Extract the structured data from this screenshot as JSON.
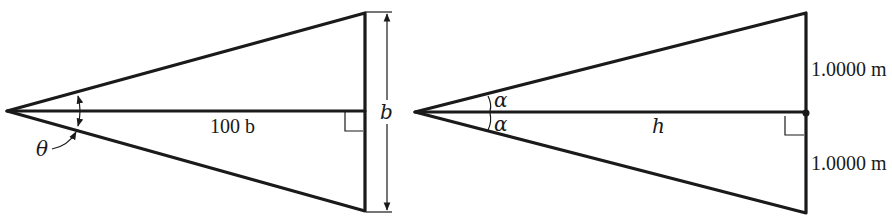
{
  "left_figure": {
    "angle_label": "θ",
    "length_label": "100 b",
    "base_label": "b"
  },
  "right_figure": {
    "angle_label_top": "α",
    "angle_label_bottom": "α",
    "length_label": "h",
    "upper_half_label": "1.0000 m",
    "lower_half_label": "1.0000 m"
  },
  "colors": {
    "ink": "#1a1a1a",
    "background": "#ffffff"
  }
}
